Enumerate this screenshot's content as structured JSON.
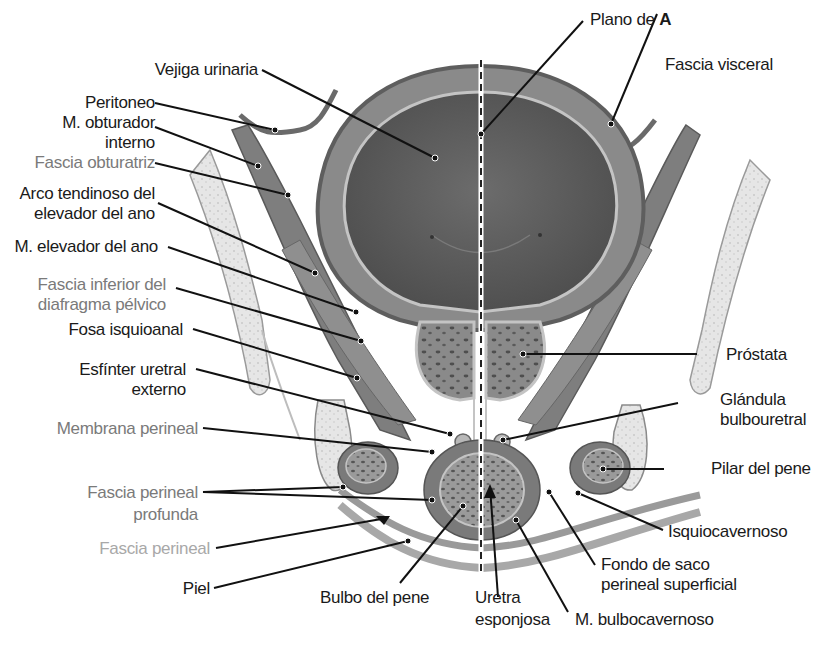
{
  "figure": {
    "colors": {
      "label_primary": "#1a1a1a",
      "label_secondary_gray": "#7a7a7a",
      "label_tertiary_gray": "#a8a8a8",
      "tissue_dark": "#5e5e5e",
      "tissue_mid": "#8c8c8c",
      "tissue_light": "#b8b8b8",
      "bone": "#e4e4e4",
      "leader_line": "#111111"
    }
  },
  "labels_left": [
    {
      "id": "vejiga",
      "text": "Vejiga urinaria"
    },
    {
      "id": "peritoneo",
      "text": "Peritoneo"
    },
    {
      "id": "obturador_1",
      "text": "M. obturador"
    },
    {
      "id": "obturador_2",
      "text": "interno"
    },
    {
      "id": "fascia_obturatriz",
      "text": "Fascia obturatriz"
    },
    {
      "id": "arco_1",
      "text": "Arco tendinoso del"
    },
    {
      "id": "arco_2",
      "text": "elevador del ano"
    },
    {
      "id": "elevador",
      "text": "M. elevador del ano"
    },
    {
      "id": "fascia_inf_1",
      "text": "Fascia inferior del"
    },
    {
      "id": "fascia_inf_2",
      "text": "diafragma pélvico"
    },
    {
      "id": "fosa",
      "text": "Fosa isquioanal"
    },
    {
      "id": "esfinter_1",
      "text": "Esfínter uretral"
    },
    {
      "id": "esfinter_2",
      "text": "externo"
    },
    {
      "id": "membrana",
      "text": "Membrana perineal"
    },
    {
      "id": "fascia_prof_1",
      "text": "Fascia perineal"
    },
    {
      "id": "fascia_prof_2",
      "text": "profunda"
    },
    {
      "id": "fascia_perineal",
      "text": "Fascia perineal"
    },
    {
      "id": "piel",
      "text": "Piel"
    }
  ],
  "labels_right": [
    {
      "id": "plano_prefix",
      "text": "Plano de "
    },
    {
      "id": "plano_bold",
      "text": "A"
    },
    {
      "id": "fascia_visceral",
      "text": "Fascia visceral"
    },
    {
      "id": "prostata",
      "text": "Próstata"
    },
    {
      "id": "glandula_1",
      "text": "Glándula"
    },
    {
      "id": "glandula_2",
      "text": "bulbouretral"
    },
    {
      "id": "pilar",
      "text": "Pilar del pene"
    },
    {
      "id": "isquio",
      "text": "Isquiocavernoso"
    },
    {
      "id": "fondo_1",
      "text": "Fondo de saco"
    },
    {
      "id": "fondo_2",
      "text": "perineal superficial"
    }
  ],
  "labels_bottom": [
    {
      "id": "bulbo",
      "text": "Bulbo del pene"
    },
    {
      "id": "uretra_1",
      "text": "Uretra"
    },
    {
      "id": "uretra_2",
      "text": "esponjosa"
    },
    {
      "id": "bulbocav",
      "text": "M. bulbocavernoso"
    }
  ]
}
